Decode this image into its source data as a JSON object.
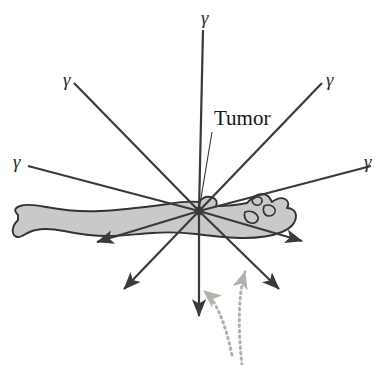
{
  "figure": {
    "background_color": "#ffffff"
  },
  "colors": {
    "ray_stroke": "#3a3a3a",
    "body_fill": "#c9c9c9",
    "body_outline": "#333333",
    "leader_line": "#333333",
    "dotted_arrow": "#b4b0ab",
    "text": "#161616"
  },
  "annotations": {
    "tumor_label": "Tumor",
    "tumor_label_position": {
      "x": 214,
      "y": 125
    },
    "leader_line": {
      "from": {
        "x": 212,
        "y": 132
      },
      "to": {
        "x": 199,
        "y": 210
      }
    }
  },
  "emission_center": {
    "x": 199,
    "y": 211
  },
  "gamma_symbol": "γ",
  "gamma_labels": [
    {
      "id": "gamma-top",
      "text": "γ",
      "x": 201,
      "y": 24
    },
    {
      "id": "gamma-upper-left",
      "text": "γ",
      "x": 63,
      "y": 86
    },
    {
      "id": "gamma-upper-right",
      "text": "γ",
      "x": 326,
      "y": 86
    },
    {
      "id": "gamma-left",
      "text": "γ",
      "x": 13,
      "y": 168
    },
    {
      "id": "gamma-right",
      "text": "γ",
      "x": 364,
      "y": 168
    }
  ],
  "rays": [
    {
      "id": "ray-up",
      "x1": 199,
      "y1": 211,
      "x2": 203,
      "y2": 30,
      "arrow": false
    },
    {
      "id": "ray-upper-left",
      "x1": 199,
      "y1": 211,
      "x2": 74,
      "y2": 83,
      "arrow": false
    },
    {
      "id": "ray-upper-right",
      "x1": 199,
      "y1": 211,
      "x2": 322,
      "y2": 83,
      "arrow": false
    },
    {
      "id": "ray-left",
      "x1": 199,
      "y1": 211,
      "x2": 28,
      "y2": 166,
      "arrow": false
    },
    {
      "id": "ray-right",
      "x1": 199,
      "y1": 211,
      "x2": 371,
      "y2": 166,
      "arrow": false
    },
    {
      "id": "ray-down",
      "x1": 199,
      "y1": 211,
      "x2": 199,
      "y2": 316,
      "arrow": true
    },
    {
      "id": "ray-lower-left",
      "x1": 199,
      "y1": 211,
      "x2": 124,
      "y2": 289,
      "arrow": true
    },
    {
      "id": "ray-lower-right",
      "x1": 199,
      "y1": 211,
      "x2": 279,
      "y2": 289,
      "arrow": true
    },
    {
      "id": "ray-out-left",
      "x1": 199,
      "y1": 211,
      "x2": 97,
      "y2": 242,
      "arrow": true
    },
    {
      "id": "ray-out-right",
      "x1": 199,
      "y1": 211,
      "x2": 302,
      "y2": 241,
      "arrow": true
    }
  ],
  "dotted_arrows": [
    {
      "id": "dotted-arrow-left",
      "path": "M 232 355 C 224 318, 215 300, 204 291",
      "arrow_tip": {
        "x": 204,
        "y": 291
      }
    },
    {
      "id": "dotted-arrow-right",
      "path": "M 242 365 C 238 330, 238 295, 245 272",
      "arrow_tip": {
        "x": 245,
        "y": 272
      }
    }
  ],
  "body": {
    "id": "supine-patient",
    "description": "Reclining human figure, head at right, feet at left",
    "outline_path": "M 18 215 C 14 211, 14 208, 20 206 C 26 204, 36 205, 46 207 C 62 210, 80 212, 100 211 C 124 210, 146 207, 168 204 C 180 202, 190 201, 199 202 C 202 198, 206 196, 211 197 C 216 198, 218 202, 216 206 C 226 206, 238 205, 247 203 C 252 198, 256 194, 262 194 C 268 194, 270 198, 272 202 C 276 199, 281 197, 285 199 C 289 201, 289 205, 287 208 C 292 208, 296 211, 296 216 C 296 223, 290 229, 282 232 C 272 236, 258 238, 244 238 C 228 238, 212 236, 196 234 C 180 232, 166 232, 152 233 C 136 234, 122 236, 108 236 C 92 236, 78 234, 64 231 C 54 229, 44 228, 36 230 C 30 231, 26 234, 22 236 C 18 238, 14 237, 13 233 C 12 229, 14 224, 18 220 Z",
    "head_detail_paths": [
      "M 252 200 C 254 197, 258 196, 261 198 C 263 200, 262 204, 259 205 C 256 206, 252 204, 252 200 Z",
      "M 264 206 C 268 204, 273 205, 275 209 C 276 213, 273 216, 269 216 C 265 216, 262 212, 264 206 Z",
      "M 245 212 C 250 210, 256 212, 258 217 C 259 221, 255 224, 251 223 C 246 222, 243 217, 245 212 Z"
    ]
  }
}
